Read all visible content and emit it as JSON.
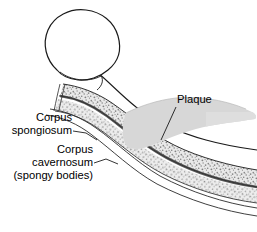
{
  "figure": {
    "type": "anatomical-illustration",
    "background_color": "#ffffff"
  },
  "labels": {
    "plaque": {
      "text": "Plaque",
      "lines": [
        "Plaque"
      ],
      "anchor": "start",
      "x": 177,
      "y": 103
    },
    "corpus_spongiosum": {
      "lines": [
        "Corpus",
        "spongiosum"
      ],
      "line1": "Corpus",
      "line2": "spongiosum",
      "anchor": "end",
      "x": 72,
      "y1": 121,
      "y2": 134
    },
    "corpus_cavernosum": {
      "lines": [
        "Corpus",
        "cavernosum",
        "(spongy bodies)"
      ],
      "line1": "Corpus",
      "line2": "cavernosum",
      "line3": "(spongy bodies)",
      "anchor": "end",
      "x": 93,
      "y1": 153,
      "y2": 166,
      "y3": 179
    }
  },
  "colors": {
    "outline": "#1a1a1a",
    "stipple_band_fill": "#e9e9e9",
    "stipple_dot": "#8a8a8a",
    "septum_dark": "#5a5a5a",
    "plaque_fill": "#d7d7d7",
    "glans_fill": "#ffffff",
    "text": "#000000",
    "background": "#ffffff"
  },
  "structures": [
    {
      "name": "glans",
      "label": "glans penis",
      "fill": "#ffffff"
    },
    {
      "name": "corpus-spongiosum-band",
      "label": "Corpus spongiosum",
      "fill": "#e9e9e9"
    },
    {
      "name": "corpus-cavernosum-band",
      "label": "Corpus cavernosum (spongy bodies)",
      "fill": "#e9e9e9"
    },
    {
      "name": "tunica-albuginea-septum",
      "label": "dark septum line",
      "fill": "#5a5a5a"
    },
    {
      "name": "plaque",
      "label": "Plaque",
      "fill": "#d7d7d7"
    },
    {
      "name": "outer-sheath",
      "label": "outer skin layers",
      "fill": "#ffffff"
    }
  ]
}
